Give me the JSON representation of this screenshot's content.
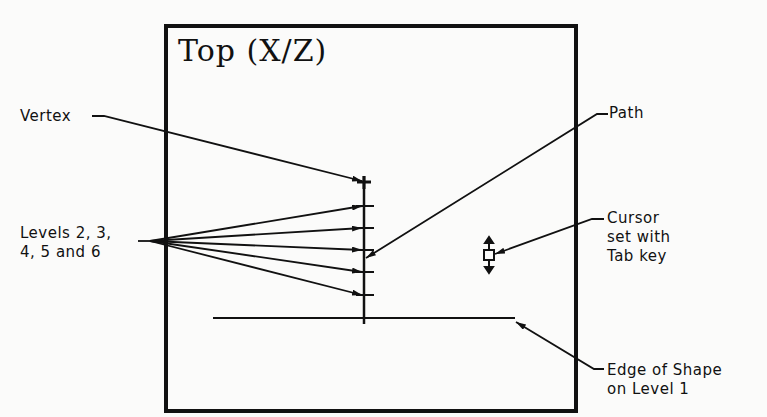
{
  "diagram": {
    "view_title": "Top (X/Z)",
    "labels": {
      "vertex": "Vertex",
      "levels_line1": "Levels 2, 3,",
      "levels_line2": "4, 5 and 6",
      "path": "Path",
      "cursor_line1": "Cursor",
      "cursor_line2": "set with",
      "cursor_line3": "Tab key",
      "edge_line1": "Edge of Shape",
      "edge_line2": "on Level 1"
    },
    "icons": {
      "cursor": "square-with-up-down-arrows"
    },
    "colors": {
      "ink": "#111111",
      "paper": "#fbfbfa"
    }
  }
}
